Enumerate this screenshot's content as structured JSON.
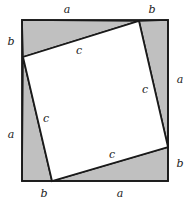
{
  "figure": {
    "name": "pythagorean-theorem-square-diagram",
    "colors": {
      "background": "#ffffff",
      "triangle_fill": "#c0c0c0",
      "inner_square_fill": "#ffffff",
      "stroke": "#1a1a1a"
    },
    "outer_square": {
      "left": 22,
      "top": 20,
      "right": 168,
      "bottom": 181
    },
    "inner_square_vertices": {
      "top": [
        139,
        21
      ],
      "right": [
        168,
        147
      ],
      "bottom": [
        52,
        181
      ],
      "left": [
        23,
        57
      ]
    },
    "triangles": [
      {
        "name": "top-triangle",
        "points": "22,20 139,21 23,57"
      },
      {
        "name": "right-triangle",
        "points": "139,21 168,20 168,147"
      },
      {
        "name": "bottom-triangle",
        "points": "168,147 168,181 52,181"
      },
      {
        "name": "left-triangle",
        "points": "52,181 22,181 23,57"
      }
    ]
  },
  "labels": {
    "outer": [
      {
        "name": "label-a-top",
        "text": "a",
        "x": 67,
        "y": 10
      },
      {
        "name": "label-b-top-right",
        "text": "b",
        "x": 152,
        "y": 10
      },
      {
        "name": "label-b-left-top",
        "text": "b",
        "x": 11,
        "y": 42
      },
      {
        "name": "label-a-left",
        "text": "a",
        "x": 11,
        "y": 135
      },
      {
        "name": "label-a-right",
        "text": "a",
        "x": 180,
        "y": 80
      },
      {
        "name": "label-b-right-bottom",
        "text": "b",
        "x": 180,
        "y": 164
      },
      {
        "name": "label-b-bottom-left",
        "text": "b",
        "x": 44,
        "y": 194
      },
      {
        "name": "label-a-bottom",
        "text": "a",
        "x": 120,
        "y": 194
      }
    ],
    "inner": [
      {
        "name": "label-c-top",
        "text": "c",
        "x": 79,
        "y": 51
      },
      {
        "name": "label-c-right",
        "text": "c",
        "x": 145,
        "y": 90
      },
      {
        "name": "label-c-left",
        "text": "c",
        "x": 46,
        "y": 119
      },
      {
        "name": "label-c-bottom",
        "text": "c",
        "x": 112,
        "y": 155
      }
    ]
  }
}
